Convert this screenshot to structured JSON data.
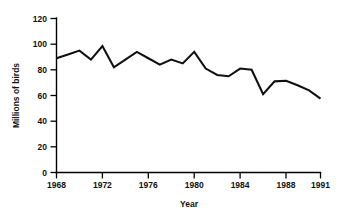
{
  "chart_data": {
    "type": "line",
    "title": "",
    "xlabel": "Year",
    "ylabel": "Millions of birds",
    "xlim": [
      1968,
      1991
    ],
    "ylim": [
      0,
      120
    ],
    "grid": false,
    "legend": "none",
    "x_ticks": [
      1968,
      1972,
      1976,
      1980,
      1984,
      1988,
      1991
    ],
    "x_tick_labels": [
      "1968",
      "1972",
      "1976",
      "1980",
      "1984",
      "1988",
      "1991"
    ],
    "y_ticks": [
      0,
      20,
      40,
      60,
      80,
      100,
      120
    ],
    "y_tick_labels": [
      "0",
      "20",
      "40",
      "60",
      "80",
      "100",
      "120"
    ],
    "series": [
      {
        "name": "Millions of birds",
        "color": "#111111",
        "x": [
          1968,
          1969,
          1970,
          1971,
          1972,
          1973,
          1974,
          1975,
          1976,
          1977,
          1978,
          1979,
          1980,
          1981,
          1982,
          1983,
          1984,
          1985,
          1986,
          1987,
          1988,
          1989,
          1990,
          1991
        ],
        "values": [
          89,
          92,
          95,
          88,
          98.5,
          82,
          88,
          94,
          89,
          84,
          88,
          85,
          94,
          81,
          76,
          75,
          81,
          80,
          61,
          71,
          71.5,
          68,
          64,
          57.5
        ]
      }
    ]
  },
  "axis": {
    "y_title": "Millions of birds",
    "x_title": "Year"
  }
}
